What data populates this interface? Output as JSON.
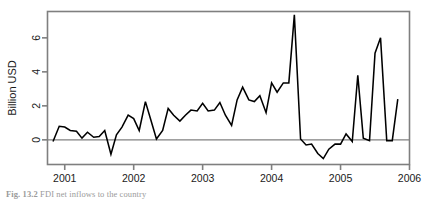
{
  "figure": {
    "caption_prefix": "Fig. 13.2",
    "caption_text": "FDI net inflows to the country"
  },
  "chart_data": {
    "type": "line",
    "title": "",
    "xlabel": "",
    "ylabel": "Billion USD",
    "xlim": [
      2000.75,
      2006.0
    ],
    "ylim": [
      -1.45,
      7.55
    ],
    "xticks": [
      2001,
      2002,
      2003,
      2004,
      2005,
      2006
    ],
    "xtick_labels": [
      "2001",
      "2002",
      "2003",
      "2004",
      "2005",
      "2006"
    ],
    "yticks": [
      0,
      2,
      4,
      6
    ],
    "ytick_labels": [
      "0",
      "2",
      "4",
      "6"
    ],
    "grid": false,
    "legend": "none",
    "zero_line": 0,
    "zero_line_color": "#808080",
    "frame_color": "#7f7f7f",
    "line_color": "#000000",
    "series": [
      {
        "name": "Billion USD",
        "x": [
          2000.83,
          2000.92,
          2001.0,
          2001.08,
          2001.17,
          2001.25,
          2001.33,
          2001.42,
          2001.5,
          2001.58,
          2001.67,
          2001.75,
          2001.83,
          2001.92,
          2002.0,
          2002.08,
          2002.17,
          2002.25,
          2002.33,
          2002.42,
          2002.5,
          2002.58,
          2002.67,
          2002.75,
          2002.83,
          2002.92,
          2003.0,
          2003.08,
          2003.17,
          2003.25,
          2003.33,
          2003.42,
          2003.5,
          2003.58,
          2003.67,
          2003.75,
          2003.83,
          2003.92,
          2004.0,
          2004.08,
          2004.17,
          2004.25,
          2004.33,
          2004.42,
          2004.5,
          2004.58,
          2004.67,
          2004.75,
          2004.83,
          2004.92,
          2005.0,
          2005.08,
          2005.17,
          2005.25,
          2005.33,
          2005.42,
          2005.5,
          2005.58,
          2005.67,
          2005.75,
          2005.83
        ],
        "values": [
          -0.1,
          0.8,
          0.75,
          0.55,
          0.5,
          0.1,
          0.45,
          0.15,
          0.2,
          0.55,
          -0.85,
          0.3,
          0.75,
          1.45,
          1.25,
          0.55,
          2.25,
          1.15,
          0.05,
          0.55,
          1.85,
          1.45,
          1.1,
          1.45,
          1.75,
          1.7,
          2.15,
          1.7,
          1.75,
          2.2,
          1.45,
          0.85,
          2.35,
          3.1,
          2.35,
          2.25,
          2.6,
          1.6,
          3.35,
          2.8,
          3.35,
          3.35,
          7.35,
          0.05,
          -0.3,
          -0.25,
          -0.8,
          -1.1,
          -0.55,
          -0.25,
          -0.25,
          0.35,
          -0.1,
          3.8,
          0.1,
          -0.05,
          5.1,
          6.0,
          -0.05,
          -0.05,
          2.4
        ]
      }
    ],
    "annotations": []
  }
}
